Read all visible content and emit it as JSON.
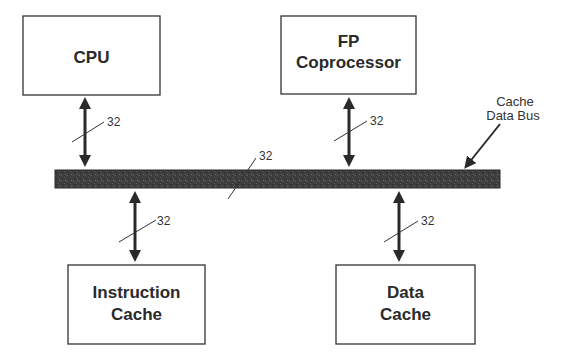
{
  "diagram": {
    "blocks": {
      "cpu": {
        "line1": "CPU"
      },
      "fp": {
        "line1": "FP",
        "line2": "Coprocessor"
      },
      "icache": {
        "line1": "Instruction",
        "line2": "Cache"
      },
      "dcache": {
        "line1": "Data",
        "line2": "Cache"
      }
    },
    "bus": {
      "label_line1": "Cache",
      "label_line2": "Data Bus",
      "width_label": "32",
      "color": "#3a3a3a"
    },
    "connections": [
      {
        "from": "cpu",
        "to": "bus",
        "width": "32"
      },
      {
        "from": "fp",
        "to": "bus",
        "width": "32"
      },
      {
        "from": "bus",
        "to": "icache",
        "width": "32"
      },
      {
        "from": "bus",
        "to": "dcache",
        "width": "32"
      }
    ]
  }
}
